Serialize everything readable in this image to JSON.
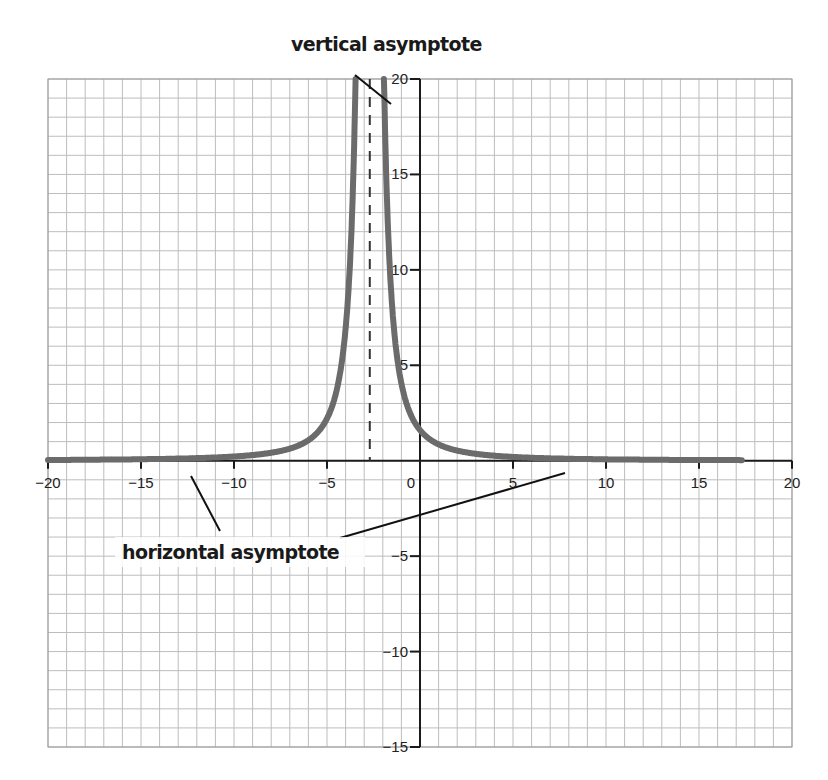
{
  "chart_data": {
    "type": "line",
    "title": "",
    "xlabel": "",
    "ylabel": "",
    "xlim": [
      -20,
      20
    ],
    "ylim": [
      -15,
      20
    ],
    "grid": true,
    "grid_step": 1,
    "x_ticks": [
      -20,
      -15,
      -10,
      -5,
      0,
      5,
      10,
      15,
      20
    ],
    "x_tick_labels": [
      "−20",
      "−15",
      "−10",
      "−5",
      "0",
      "5",
      "10",
      "15",
      "20"
    ],
    "y_ticks": [
      20,
      15,
      10,
      5,
      -5,
      -10,
      -15
    ],
    "y_tick_labels": [
      "20",
      "15",
      "10",
      "5",
      "−5",
      "−10",
      "−15"
    ],
    "series": [
      {
        "name": "curve",
        "color": "#6b6b6b",
        "description": "y = k/(x+2.7)^2, two branches rising toward vertical asymptote",
        "points_left": [
          [
            -20,
            0.04
          ],
          [
            -15,
            0.08
          ],
          [
            -10,
            0.22
          ],
          [
            -7,
            0.63
          ],
          [
            -5,
            2.2
          ],
          [
            -4.5,
            3.6
          ],
          [
            -4,
            6.9
          ],
          [
            -3.7,
            11.7
          ],
          [
            -3.5,
            18.3
          ]
        ],
        "points_right": [
          [
            -1.9,
            18.3
          ],
          [
            -1.7,
            11.7
          ],
          [
            -1.4,
            6.9
          ],
          [
            -1,
            4.0
          ],
          [
            0,
            1.6
          ],
          [
            2,
            0.53
          ],
          [
            5,
            0.2
          ],
          [
            10,
            0.07
          ],
          [
            17.3,
            0.03
          ]
        ]
      }
    ],
    "vertical_asymptote_x": -2.7,
    "horizontal_asymptote_y": 0,
    "annotations": [
      {
        "text": "vertical asymptote",
        "points_to": "dashed line x≈-2.7"
      },
      {
        "text": "horizontal asymptote",
        "points_to": "x-axis y=0"
      }
    ]
  },
  "labels": {
    "vertical": "vertical asymptote",
    "horizontal": "horizontal asymptote"
  }
}
